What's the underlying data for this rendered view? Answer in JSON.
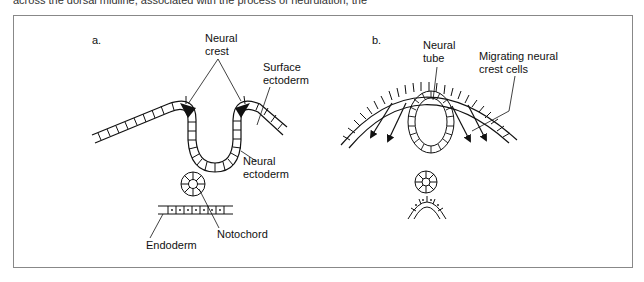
{
  "page": {
    "caption_fragment": "across the dorsal midline, associated with the process of neurulation, the"
  },
  "figure": {
    "panel_a": {
      "label": "a.",
      "annotations": {
        "neural_crest": [
          "Neural",
          "crest"
        ],
        "surface_ectoderm": [
          "Surface",
          "ectoderm"
        ],
        "neural_ectoderm": [
          "Neural",
          "ectoderm"
        ],
        "notochord": "Notochord",
        "endoderm": "Endoderm"
      }
    },
    "panel_b": {
      "label": "b.",
      "annotations": {
        "neural_tube": [
          "Neural",
          "tube"
        ],
        "migrating_neural_crest_cells": [
          "Migrating neural",
          "crest cells"
        ]
      }
    },
    "colors": {
      "line": "#111111",
      "frame": "#888888",
      "background": "#ffffff"
    }
  }
}
